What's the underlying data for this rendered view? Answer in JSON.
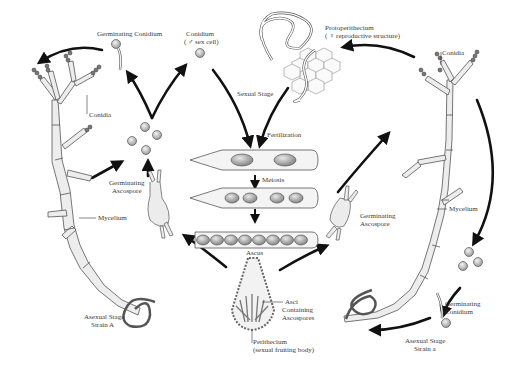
{
  "diagram": {
    "type": "life-cycle",
    "labels": {
      "germinating_conidium_left": "Germinating Conidium",
      "conidium": "Conidium",
      "conidium_sub": "( ♂ sex cell)",
      "protoperithecium": "Protoperithecium",
      "protoperithecium_sub": "( ♀ reproductive structure)",
      "conidia_left": "Conidia",
      "conidia_right": "Conidia",
      "sexual_stage": "Sexual Stage",
      "fertilization": "Fertilization",
      "meiosis": "Meiosis",
      "ascus": "Ascus",
      "germinating_ascospore_left_1": "Germinating",
      "germinating_ascospore_left_2": "Ascospore",
      "germinating_ascospore_right_1": "Germinating",
      "germinating_ascospore_right_2": "Ascospore",
      "mycelium_left": "Mycelium",
      "mycelium_right": "Mycelium",
      "asci_1": "Asci",
      "asci_2": "Containing",
      "asci_3": "Ascospores",
      "perithecium_1": "Perithecium",
      "perithecium_2": "(sexual fruiting body)",
      "asexual_a_1": "Asexual Stage",
      "asexual_a_2": "Strain A",
      "asexual_b_1": "Asexual Stage",
      "asexual_b_2": "Strain a",
      "germinating_conidium_right_1": "Germinating",
      "germinating_conidium_right_2": "Conidium"
    },
    "nodes": [
      {
        "id": "strain-A",
        "label": "Asexual Stage Strain A"
      },
      {
        "id": "strain-a",
        "label": "Asexual Stage Strain a"
      },
      {
        "id": "conidium",
        "label": "Conidium (male sex cell)"
      },
      {
        "id": "protoperithecium",
        "label": "Protoperithecium (female reproductive structure)"
      },
      {
        "id": "ascus",
        "label": "Ascus (Fertilization → Meiosis)"
      },
      {
        "id": "perithecium",
        "label": "Perithecium (sexual fruiting body)"
      },
      {
        "id": "germinating-ascospore",
        "label": "Germinating Ascospore"
      },
      {
        "id": "germinating-conidium",
        "label": "Germinating Conidium"
      }
    ],
    "edges": [
      {
        "from": "strain-A",
        "to": "conidia"
      },
      {
        "from": "conidia",
        "to": "germinating-conidium"
      },
      {
        "from": "germinating-conidium",
        "to": "strain-A"
      },
      {
        "from": "conidia",
        "to": "conidium"
      },
      {
        "from": "conidium",
        "to": "ascus",
        "label": "Sexual Stage"
      },
      {
        "from": "strain-a",
        "to": "protoperithecium"
      },
      {
        "from": "protoperithecium",
        "to": "ascus"
      },
      {
        "from": "ascus",
        "to": "perithecium"
      },
      {
        "from": "perithecium",
        "to": "germinating-ascospore"
      },
      {
        "from": "germinating-ascospore",
        "to": "strain-A"
      },
      {
        "from": "germinating-ascospore",
        "to": "strain-a"
      },
      {
        "from": "strain-a",
        "to": "conidia-right"
      },
      {
        "from": "conidia-right",
        "to": "germinating-conidium-right"
      },
      {
        "from": "germinating-conidium-right",
        "to": "strain-a"
      }
    ],
    "colors": {
      "ink": "#1a1a1a",
      "line": "#555555",
      "fill": "#e6e6e6",
      "spore": "#c8c8c8"
    }
  }
}
